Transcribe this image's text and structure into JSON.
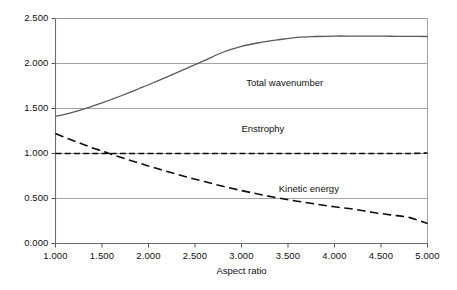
{
  "chart_data": {
    "type": "line",
    "title": "",
    "xlabel": "Aspect ratio",
    "ylabel": "",
    "xlim": [
      1.0,
      5.0
    ],
    "ylim": [
      0.0,
      2.5
    ],
    "grid": true,
    "grid_axis": "y",
    "legend_position": "inline-annotations",
    "x_tick_labels": [
      "1.000",
      "1.500",
      "2.000",
      "2.500",
      "3.000",
      "3.500",
      "4.000",
      "4.500",
      "5.000"
    ],
    "x_ticks": [
      1.0,
      1.5,
      2.0,
      2.5,
      3.0,
      3.5,
      4.0,
      4.5,
      5.0
    ],
    "y_tick_labels": [
      "0.000",
      "0.500",
      "1.000",
      "1.500",
      "2.000",
      "2.500"
    ],
    "y_ticks": [
      0.0,
      0.5,
      1.0,
      1.5,
      2.0,
      2.5
    ],
    "x": [
      1.0,
      1.1,
      1.2,
      1.3,
      1.4,
      1.5,
      1.6,
      1.7,
      1.8,
      1.9,
      2.0,
      2.2,
      2.4,
      2.6,
      2.8,
      3.0,
      3.2,
      3.4,
      3.6,
      3.8,
      4.0,
      4.2,
      4.4,
      4.6,
      4.8,
      5.0
    ],
    "series": [
      {
        "name": "Total wavenumber",
        "style": "solid",
        "color": "#595959",
        "label_x": 3.05,
        "label_y": 1.78,
        "values": [
          1.414,
          1.435,
          1.462,
          1.493,
          1.526,
          1.562,
          1.6,
          1.639,
          1.68,
          1.722,
          1.764,
          1.851,
          1.941,
          2.032,
          2.125,
          2.191,
          2.233,
          2.264,
          2.29,
          2.3,
          2.305,
          2.305,
          2.305,
          2.303,
          2.301,
          2.3
        ]
      },
      {
        "name": "Enstrophy",
        "style": "dashed",
        "color": "#0d0d0d",
        "label_x": 3.0,
        "label_y": 1.27,
        "values": [
          1.0,
          1.0,
          1.0,
          1.0,
          1.0,
          1.0,
          1.0,
          1.0,
          1.0,
          1.0,
          1.0,
          1.0,
          1.0,
          1.0,
          1.0,
          1.0,
          1.0,
          1.0,
          1.0,
          1.0,
          1.0,
          1.0,
          1.0,
          1.0,
          1.0,
          1.005
        ]
      },
      {
        "name": "Kinetic energy",
        "style": "dashed-long",
        "color": "#0d0d0d",
        "label_x": 3.4,
        "label_y": 0.6,
        "values": [
          1.222,
          1.18,
          1.14,
          1.1,
          1.062,
          1.028,
          0.992,
          0.958,
          0.925,
          0.894,
          0.862,
          0.8,
          0.742,
          0.688,
          0.636,
          0.588,
          0.545,
          0.505,
          0.47,
          0.438,
          0.408,
          0.382,
          0.348,
          0.318,
          0.29,
          0.222
        ]
      }
    ]
  },
  "axis": {
    "x_title": "Aspect ratio"
  }
}
